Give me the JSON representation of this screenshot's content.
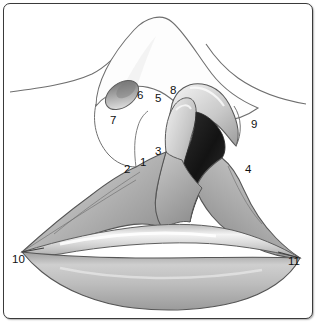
{
  "figure": {
    "border_color": "#3a3a3a",
    "background_color": "#ffffff",
    "ink_color": "#4a4a4a",
    "label_color": "#111111",
    "cavity_color": "#1d1d1d",
    "tissue_light": "#f0f0f0",
    "tissue_mid": "#bdbdbd",
    "tissue_dark": "#8d8d8d"
  },
  "labels": [
    {
      "id": "1",
      "text": "1",
      "x": 140,
      "y": 157
    },
    {
      "id": "2",
      "text": "2",
      "x": 124,
      "y": 164
    },
    {
      "id": "3",
      "text": "3",
      "x": 155,
      "y": 146
    },
    {
      "id": "4",
      "text": "4",
      "x": 245,
      "y": 164
    },
    {
      "id": "5",
      "text": "5",
      "x": 155,
      "y": 93
    },
    {
      "id": "6",
      "text": "6",
      "x": 137,
      "y": 90
    },
    {
      "id": "7",
      "text": "7",
      "x": 110,
      "y": 115
    },
    {
      "id": "8",
      "text": "8",
      "x": 170,
      "y": 85
    },
    {
      "id": "9",
      "text": "9",
      "x": 251,
      "y": 119
    },
    {
      "id": "10",
      "text": "10",
      "x": 12,
      "y": 254
    },
    {
      "id": "11",
      "text": "11",
      "x": 288,
      "y": 256
    }
  ]
}
